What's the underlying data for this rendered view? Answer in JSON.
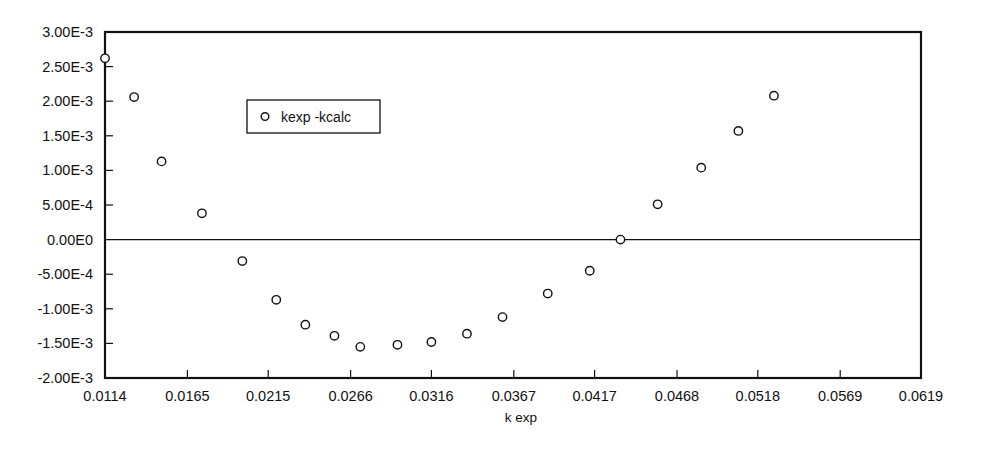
{
  "chart_data": {
    "type": "scatter",
    "title": "",
    "xlabel": "k exp",
    "ylabel": "",
    "xlim": [
      0.0114,
      0.0619
    ],
    "ylim": [
      -0.002,
      0.003
    ],
    "grid": false,
    "legend_position": "upper-left-inside",
    "x_tick_labels": [
      "0.0114",
      "0.0165",
      "0.0215",
      "0.0266",
      "0.0316",
      "0.0367",
      "0.0417",
      "0.0468",
      "0.0518",
      "0.0569",
      "0.0619"
    ],
    "x_tick_values": [
      0.0114,
      0.0165,
      0.0215,
      0.0266,
      0.0316,
      0.0367,
      0.0417,
      0.0468,
      0.0518,
      0.0569,
      0.0619
    ],
    "y_tick_labels": [
      "3.00E-3",
      "2.50E-3",
      "2.00E-3",
      "1.50E-3",
      "1.00E-3",
      "5.00E-4",
      "0.00E0",
      "-5.00E-4",
      "-1.00E-3",
      "-1.50E-3",
      "-2.00E-3"
    ],
    "y_tick_values": [
      0.003,
      0.0025,
      0.002,
      0.0015,
      0.001,
      0.0005,
      0.0,
      -0.0005,
      -0.001,
      -0.0015,
      -0.002
    ],
    "series": [
      {
        "name": "kexp -kcalc",
        "marker": "open-circle",
        "color": "#111111",
        "points": [
          [
            0.0114,
            0.00262
          ],
          [
            0.0132,
            0.00206
          ],
          [
            0.0149,
            0.00113
          ],
          [
            0.0174,
            0.00038
          ],
          [
            0.0199,
            -0.00031
          ],
          [
            0.022,
            -0.00087
          ],
          [
            0.0238,
            -0.00123
          ],
          [
            0.0256,
            -0.00139
          ],
          [
            0.0272,
            -0.00155
          ],
          [
            0.0295,
            -0.00152
          ],
          [
            0.0316,
            -0.00148
          ],
          [
            0.0338,
            -0.00136
          ],
          [
            0.036,
            -0.00112
          ],
          [
            0.0388,
            -0.00078
          ],
          [
            0.0414,
            -0.00045
          ],
          [
            0.0433,
            0.0
          ],
          [
            0.0456,
            0.00051
          ],
          [
            0.0483,
            0.00104
          ],
          [
            0.0506,
            0.00157
          ],
          [
            0.0528,
            0.00208
          ]
        ]
      }
    ]
  },
  "axis": {
    "x_axis_title": "k exp"
  },
  "legend": {
    "entries": [
      {
        "label": "kexp -kcalc",
        "marker": "open-circle"
      }
    ]
  }
}
